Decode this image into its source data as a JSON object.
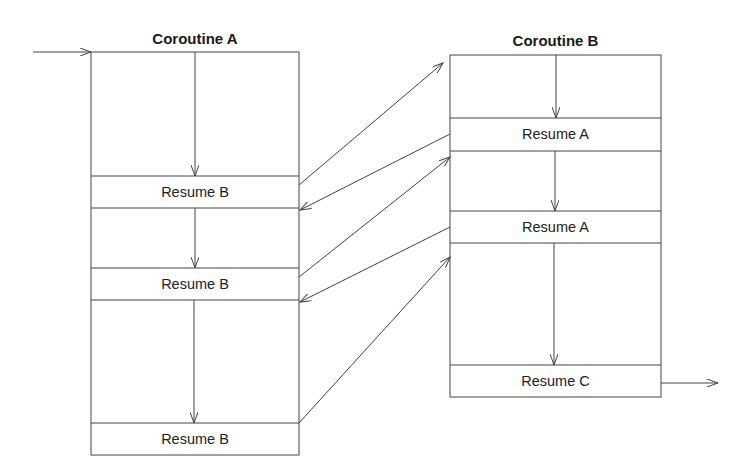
{
  "diagram": {
    "type": "coroutine-control-flow",
    "colors": {
      "line": "#444444",
      "text": "#222222",
      "background": "#ffffff"
    },
    "coroutines": [
      {
        "id": "A",
        "title": "Coroutine A",
        "box": {
          "x": 91,
          "y": 52,
          "w": 208,
          "h": 403
        },
        "sections": [
          {
            "label": "Resume B",
            "y": 176,
            "h": 32
          },
          {
            "label": "Resume B",
            "y": 268,
            "h": 32
          },
          {
            "label": "Resume B",
            "y": 423,
            "h": 32
          }
        ]
      },
      {
        "id": "B",
        "title": "Coroutine B",
        "box": {
          "x": 450,
          "y": 55,
          "w": 211,
          "h": 342
        },
        "sections": [
          {
            "label": "Resume A",
            "y": 118,
            "h": 33
          },
          {
            "label": "Resume A",
            "y": 211,
            "h": 32
          },
          {
            "label": "Resume C",
            "y": 365,
            "h": 32
          }
        ]
      }
    ],
    "transfers": [
      {
        "from": "A: Resume B #1",
        "to": "B start"
      },
      {
        "from": "B: Resume A #1",
        "to": "A after Resume B #1"
      },
      {
        "from": "A: Resume B #2",
        "to": "B after Resume A #1"
      },
      {
        "from": "B: Resume A #2",
        "to": "A after Resume B #2"
      },
      {
        "from": "A: Resume B #3",
        "to": "B after Resume A #2"
      }
    ],
    "entry": "arrow into Coroutine A",
    "exit": "arrow out of Resume C"
  }
}
